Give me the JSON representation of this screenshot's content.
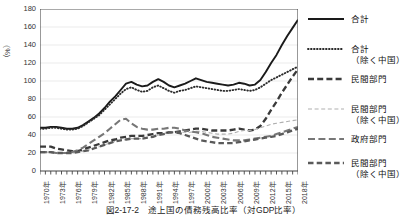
{
  "figure": {
    "caption": "図2-17-2　途上国の債務残高比率（対GDP比率）",
    "y_axis_label": "（%）"
  },
  "legend": {
    "items": [
      {
        "label_line1": "合計",
        "label_line2": "",
        "style": "solid-thick",
        "icon": "legend-line-solid-icon"
      },
      {
        "label_line1": "合計",
        "label_line2": "（除く中国）",
        "style": "dotted",
        "icon": "legend-line-dotted-icon"
      },
      {
        "label_line1": "民間部門",
        "label_line2": "",
        "style": "dashed-thick",
        "icon": "legend-line-dashed-thick-icon"
      },
      {
        "label_line1": "民間部門",
        "label_line2": "（除く中国）",
        "style": "dashed-thin",
        "icon": "legend-line-dashed-thin-icon"
      },
      {
        "label_line1": "政府部門",
        "label_line2": "",
        "style": "dashed-thick-gray",
        "icon": "legend-line-dashed-gray-icon"
      },
      {
        "label_line1": "民間部門",
        "label_line2": "（除く中国）",
        "style": "dashed-medium",
        "icon": "legend-line-dashed-medium-icon"
      }
    ]
  },
  "chart_data": {
    "type": "line",
    "title": "図2-17-2　途上国の債務残高比率（対GDP比率）",
    "xlabel": "",
    "ylabel": "（%）",
    "ylim": [
      0,
      180
    ],
    "ytick_values": [
      0,
      20,
      40,
      60,
      80,
      100,
      120,
      140,
      160,
      180
    ],
    "ytick_labels": [
      "0",
      "20",
      "40",
      "60",
      "80",
      "100",
      "120",
      "140",
      "160",
      "180"
    ],
    "grid": true,
    "legend_position": "right",
    "x": [
      1970,
      1971,
      1972,
      1973,
      1974,
      1975,
      1976,
      1977,
      1978,
      1979,
      1980,
      1981,
      1982,
      1983,
      1984,
      1985,
      1986,
      1987,
      1988,
      1989,
      1990,
      1991,
      1992,
      1993,
      1994,
      1995,
      1996,
      1997,
      1998,
      1999,
      2000,
      2001,
      2002,
      2003,
      2004,
      2005,
      2006,
      2007,
      2008,
      2009,
      2010,
      2011,
      2012,
      2013,
      2014,
      2015,
      2016,
      2017,
      2018
    ],
    "xtick_labels": [
      "1970年",
      "1973年",
      "1976年",
      "1979年",
      "1982年",
      "1985年",
      "1988年",
      "1991年",
      "1994年",
      "1997年",
      "2000年",
      "2003年",
      "2006年",
      "2009年",
      "2012年",
      "2015年",
      "2018年"
    ],
    "xtick_values": [
      1970,
      1973,
      1976,
      1979,
      1982,
      1985,
      1988,
      1991,
      1994,
      1997,
      2000,
      2003,
      2006,
      2009,
      2012,
      2015,
      2018
    ],
    "series": [
      {
        "name": "合計",
        "style": "solid-thick",
        "values": [
          48,
          48,
          49,
          49,
          48,
          47,
          47,
          48,
          51,
          55,
          59,
          64,
          70,
          77,
          83,
          90,
          97,
          99,
          96,
          94,
          95,
          99,
          102,
          99,
          95,
          93,
          95,
          97,
          100,
          103,
          101,
          99,
          98,
          97,
          96,
          95,
          96,
          98,
          97,
          95,
          96,
          101,
          110,
          120,
          129,
          140,
          150,
          159,
          168
        ]
      },
      {
        "name": "合計（除く中国）",
        "style": "dotted",
        "values": [
          47,
          47,
          48,
          48,
          47,
          46,
          46,
          47,
          50,
          54,
          58,
          62,
          68,
          74,
          80,
          86,
          91,
          93,
          90,
          88,
          89,
          93,
          95,
          92,
          89,
          87,
          89,
          90,
          92,
          94,
          93,
          92,
          91,
          90,
          89,
          89,
          90,
          91,
          90,
          89,
          90,
          93,
          97,
          101,
          104,
          107,
          110,
          113,
          116
        ]
      },
      {
        "name": "民間部門",
        "style": "dashed-thick",
        "values": [
          27,
          27,
          27,
          25,
          24,
          23,
          22,
          22,
          24,
          26,
          28,
          30,
          32,
          34,
          35,
          37,
          38,
          39,
          39,
          39,
          40,
          41,
          42,
          42,
          43,
          43,
          44,
          45,
          46,
          47,
          47,
          46,
          45,
          45,
          45,
          45,
          46,
          47,
          46,
          45,
          46,
          50,
          58,
          68,
          77,
          87,
          96,
          105,
          113
        ]
      },
      {
        "name": "民間部門（除く中国）",
        "style": "dashed-thin",
        "values": [
          21,
          21,
          21,
          20,
          20,
          20,
          20,
          21,
          22,
          23,
          25,
          27,
          29,
          31,
          33,
          34,
          35,
          36,
          36,
          36,
          37,
          38,
          40,
          41,
          43,
          43,
          43,
          43,
          43,
          44,
          44,
          43,
          42,
          41,
          41,
          41,
          42,
          44,
          45,
          45,
          46,
          48,
          50,
          52,
          53,
          54,
          55,
          56,
          57
        ]
      },
      {
        "name": "政府部門",
        "style": "dashed-thick-gray",
        "values": [
          21,
          21,
          21,
          20,
          20,
          20,
          21,
          23,
          26,
          30,
          34,
          38,
          42,
          47,
          52,
          57,
          58,
          53,
          49,
          47,
          46,
          46,
          47,
          47,
          48,
          48,
          47,
          45,
          44,
          43,
          42,
          40,
          38,
          37,
          36,
          35,
          34,
          34,
          34,
          35,
          36,
          37,
          38,
          39,
          41,
          43,
          45,
          47,
          49
        ]
      },
      {
        "name": "民間部門（除く中国）",
        "style": "dashed-medium",
        "values": [
          21,
          21,
          21,
          20,
          20,
          20,
          20,
          21,
          22,
          23,
          25,
          27,
          29,
          31,
          33,
          34,
          35,
          36,
          36,
          36,
          37,
          38,
          40,
          41,
          43,
          43,
          42,
          40,
          38,
          36,
          34,
          33,
          32,
          31,
          31,
          31,
          31,
          32,
          33,
          34,
          35,
          36,
          37,
          38,
          39,
          41,
          43,
          45,
          47
        ]
      }
    ]
  }
}
